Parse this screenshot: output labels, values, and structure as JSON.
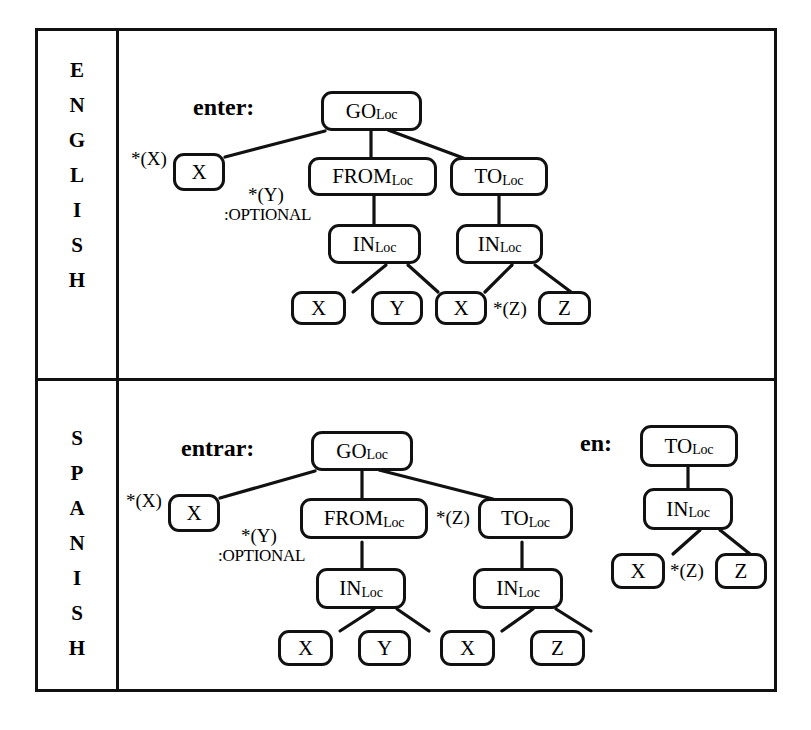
{
  "figure": {
    "rows": [
      {
        "language": "ENGLISH",
        "letters": [
          "E",
          "N",
          "G",
          "L",
          "I",
          "S",
          "H"
        ],
        "trees": [
          {
            "headword": "enter:",
            "nodes": [
              {
                "id": "go",
                "label": "GO",
                "sub": "Loc"
              },
              {
                "id": "x1",
                "label": "X",
                "sub": ""
              },
              {
                "id": "from",
                "label": "FROM",
                "sub": "Loc"
              },
              {
                "id": "to",
                "label": "TO",
                "sub": "Loc"
              },
              {
                "id": "in1",
                "label": "IN",
                "sub": "Loc"
              },
              {
                "id": "in2",
                "label": "IN",
                "sub": "Loc"
              },
              {
                "id": "x2",
                "label": "X",
                "sub": ""
              },
              {
                "id": "y1",
                "label": "Y",
                "sub": ""
              },
              {
                "id": "x3",
                "label": "X",
                "sub": ""
              },
              {
                "id": "z1",
                "label": "Z",
                "sub": ""
              }
            ],
            "annotations": [
              {
                "id": "ax",
                "text": "*(X)"
              },
              {
                "id": "ay",
                "text": "*(Y)"
              },
              {
                "id": "aopt",
                "text": ":OPTIONAL"
              },
              {
                "id": "az",
                "text": "*(Z)"
              }
            ]
          }
        ]
      },
      {
        "language": "SPANISH",
        "letters": [
          "S",
          "P",
          "A",
          "N",
          "I",
          "S",
          "H"
        ],
        "trees": [
          {
            "headword": "entrar:",
            "nodes": [
              {
                "id": "go",
                "label": "GO",
                "sub": "Loc"
              },
              {
                "id": "x1",
                "label": "X",
                "sub": ""
              },
              {
                "id": "from",
                "label": "FROM",
                "sub": "Loc"
              },
              {
                "id": "to",
                "label": "TO",
                "sub": "Loc"
              },
              {
                "id": "in1",
                "label": "IN",
                "sub": "Loc"
              },
              {
                "id": "in2",
                "label": "IN",
                "sub": "Loc"
              },
              {
                "id": "x2",
                "label": "X",
                "sub": ""
              },
              {
                "id": "y1",
                "label": "Y",
                "sub": ""
              },
              {
                "id": "x3",
                "label": "X",
                "sub": ""
              },
              {
                "id": "z1",
                "label": "Z",
                "sub": ""
              }
            ],
            "annotations": [
              {
                "id": "ax",
                "text": "*(X)"
              },
              {
                "id": "ay",
                "text": "*(Y)"
              },
              {
                "id": "aopt",
                "text": ":OPTIONAL"
              },
              {
                "id": "az",
                "text": "*(Z)"
              }
            ]
          },
          {
            "headword": "en:",
            "nodes": [
              {
                "id": "to",
                "label": "TO",
                "sub": "Loc"
              },
              {
                "id": "in1",
                "label": "IN",
                "sub": "Loc"
              },
              {
                "id": "x1",
                "label": "X",
                "sub": ""
              },
              {
                "id": "z1",
                "label": "Z",
                "sub": ""
              }
            ],
            "annotations": [
              {
                "id": "az",
                "text": "*(Z)"
              }
            ]
          }
        ]
      }
    ],
    "colors": {
      "ink": "#111111",
      "paper": "#ffffff"
    }
  }
}
